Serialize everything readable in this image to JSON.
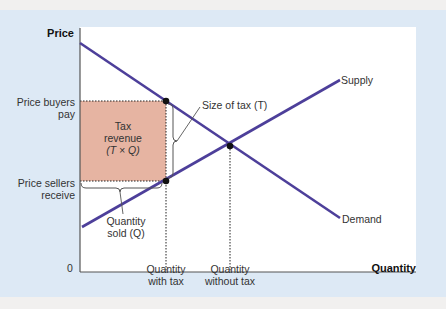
{
  "diagram": {
    "type": "supply-demand-tax",
    "axes": {
      "y_label": "Price",
      "x_label": "Quantity",
      "origin": "0"
    },
    "curves": [
      {
        "name": "Supply",
        "label": "Supply"
      },
      {
        "name": "Demand",
        "label": "Demand"
      }
    ],
    "price_labels": {
      "buyers": [
        "Price buyers",
        "pay"
      ],
      "sellers": [
        "Price sellers",
        "receive"
      ]
    },
    "quantity_labels": {
      "with_tax": [
        "Quantity",
        "with tax"
      ],
      "without_tax": [
        "Quantity",
        "without tax"
      ]
    },
    "tax_revenue": [
      "Tax",
      "revenue",
      "(T × Q)"
    ],
    "annotations": {
      "size_of_tax": "Size of tax (T)",
      "quantity_sold": [
        "Quantity",
        "sold (Q)"
      ]
    },
    "colors": {
      "curve": "#4d3f9a",
      "revenue_fill": "#e6b4a2",
      "background": "#dde9f5",
      "plot": "#ffffff"
    }
  }
}
